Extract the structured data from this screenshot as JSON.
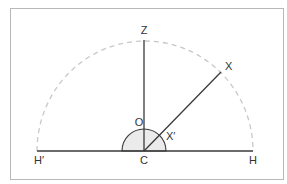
{
  "diagram": {
    "labels": {
      "zenith": "Z",
      "star": "X",
      "observer": "O",
      "star_projection": "X′",
      "center": "C",
      "horizon_east": "H",
      "horizon_west": "H′"
    },
    "colors": {
      "frame": "#b8b8b8",
      "lines": "#3a3a3a",
      "dashed_arc": "#c8c8c8",
      "small_arc_fill": "#ebebeb"
    }
  }
}
